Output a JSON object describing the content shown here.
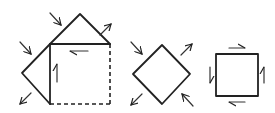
{
  "diagram": {
    "colors": {
      "line": "#222222",
      "background": "#ffffff"
    },
    "figures": [
      {
        "id": "composite",
        "shapes": [
          "square-with-triangles"
        ],
        "dashed_edges": [
          "right",
          "bottom"
        ]
      },
      {
        "id": "diamond",
        "shapes": [
          "rotated-square"
        ],
        "arrows": [
          "tension-ne",
          "tension-sw",
          "compression-nw",
          "compression-se"
        ]
      },
      {
        "id": "shear-square",
        "shapes": [
          "square"
        ],
        "arrows": [
          "shear-top-right",
          "shear-bottom-left",
          "shear-left-down",
          "shear-right-up"
        ]
      }
    ]
  }
}
